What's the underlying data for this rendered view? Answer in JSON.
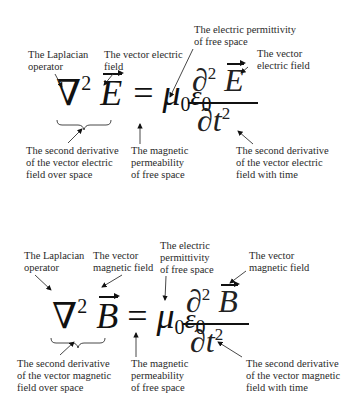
{
  "diagrams": [
    {
      "id": "electric",
      "equation": {
        "lhs_operator": "∇",
        "lhs_power": "2",
        "lhs_field": "E",
        "equals": "=",
        "mu": "μ",
        "mu_sub": "0",
        "epsilon": "ε",
        "epsilon_sub": "0",
        "num_partial": "∂",
        "num_power": "2",
        "num_field": "E",
        "den_partial": "∂",
        "den_var": "t",
        "den_power": "2"
      },
      "labels": {
        "laplacian": "The Laplacian\noperator",
        "vector_field_lhs": "The vector electric\nfield",
        "permittivity": "The electric permittivity\nof free space",
        "vector_field_rhs": "The vector\nelectric field",
        "second_derivative_space": "The second derivative\nof the vector electric\nfield over space",
        "permeability": "The magnetic\npermeability\nof free space",
        "second_derivative_time": "The second derivative\nof the vector electric\nfield with time"
      }
    },
    {
      "id": "magnetic",
      "equation": {
        "lhs_operator": "∇",
        "lhs_power": "2",
        "lhs_field": "B",
        "equals": "=",
        "mu": "μ",
        "mu_sub": "0",
        "epsilon": "ε",
        "epsilon_sub": "0",
        "num_partial": "∂",
        "num_power": "2",
        "num_field": "B",
        "den_partial": "∂",
        "den_var": "t",
        "den_power": "2"
      },
      "labels": {
        "laplacian": "The Laplacian\noperator",
        "vector_field_lhs": "The vector\nmagnetic field",
        "permittivity": "The electric\npermittivity\nof free space",
        "vector_field_rhs": "The vector\nmagnetic field",
        "second_derivative_space": "The second derivative\nof the vector magnetic\nfield over space",
        "permeability": "The magnetic\npermeability\nof free space",
        "second_derivative_time": "The second derivative\nof the vector magnetic\nfield with time"
      }
    }
  ]
}
